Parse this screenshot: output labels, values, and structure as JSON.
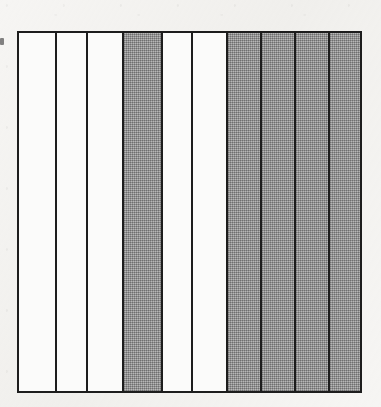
{
  "figure": {
    "frame": {
      "left": 17,
      "top": 31,
      "width": 345,
      "height": 362,
      "border_width": 2,
      "border_color": "#1d1d1d"
    },
    "colors": {
      "page_background": "#f6f5f3",
      "stripe_white": "#fbfbfa",
      "stripe_gray": "#9d9d9d",
      "line": "#1d1d1d"
    },
    "divider_positions": [
      17,
      55,
      87,
      123,
      163,
      193,
      228,
      263,
      297,
      332,
      362
    ],
    "stripe_count": 10,
    "stripes": [
      {
        "index": 1,
        "fill": "white",
        "label": "stripe-1",
        "width": 38
      },
      {
        "index": 2,
        "fill": "white",
        "label": "stripe-2",
        "width": 32
      },
      {
        "index": 3,
        "fill": "white",
        "label": "stripe-3",
        "width": 36
      },
      {
        "index": 4,
        "fill": "gray",
        "label": "stripe-4",
        "width": 40
      },
      {
        "index": 5,
        "fill": "white",
        "label": "stripe-5",
        "width": 30
      },
      {
        "index": 6,
        "fill": "white",
        "label": "stripe-6",
        "width": 35
      },
      {
        "index": 7,
        "fill": "gray",
        "label": "stripe-7",
        "width": 35
      },
      {
        "index": 8,
        "fill": "gray",
        "label": "stripe-8",
        "width": 34
      },
      {
        "index": 9,
        "fill": "gray",
        "label": "stripe-9",
        "width": 35
      },
      {
        "index": 10,
        "fill": "gray",
        "label": "stripe-10",
        "width": 30
      }
    ]
  },
  "artifacts": {
    "left_margin_mark": {
      "left": 0,
      "top": 38,
      "width": 4,
      "height": 7
    }
  }
}
